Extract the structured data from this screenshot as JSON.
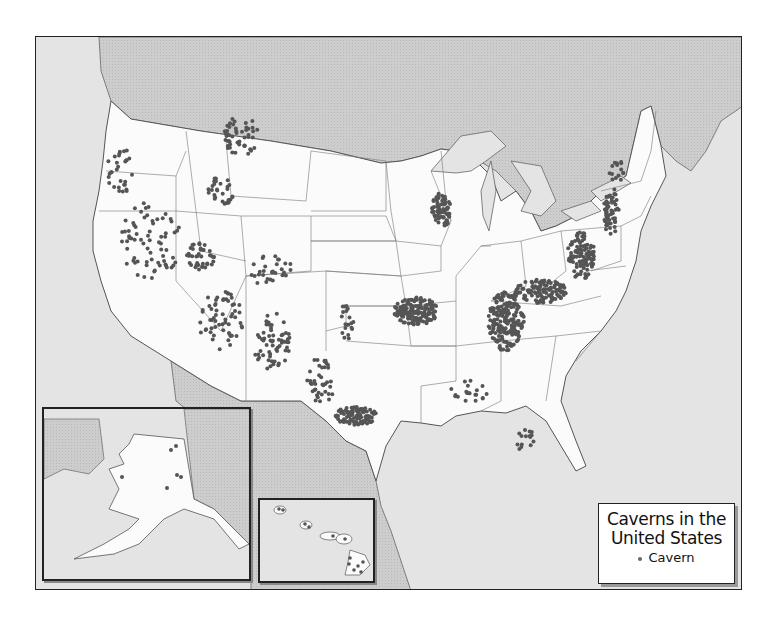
{
  "map": {
    "title_line1": "Caverns in the",
    "title_line2": "United States",
    "legend": {
      "symbol": "dot",
      "label": "Cavern"
    },
    "colors": {
      "ocean": "#e4e4e4",
      "foreign_land": "#c9c9c9",
      "us_land": "#fbfbfb",
      "borders": "#555555",
      "cavern_dot": "#555555",
      "frame": "#222222"
    },
    "insets": [
      {
        "name": "Alaska",
        "cavern_count_visible": 6
      },
      {
        "name": "Hawaii",
        "cavern_count_visible": 12
      }
    ],
    "regions_with_dense_caverns": [
      "Appalachian belt (Pennsylvania to Alabama)",
      "Kentucky-Tennessee karst",
      "Missouri Ozarks",
      "Central Texas (Edwards Plateau)",
      "Northeast Iowa / southwest Wisconsin",
      "Great Basin / Rocky Mountain West"
    ]
  }
}
